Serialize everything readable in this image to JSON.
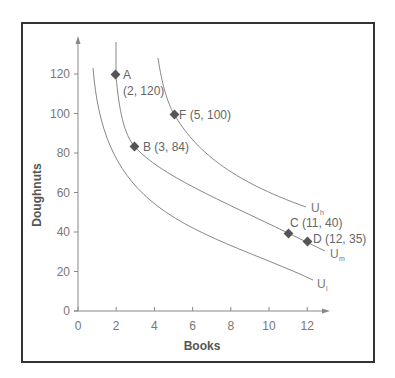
{
  "chart_data": {
    "type": "line",
    "title": "",
    "xlabel": "Books",
    "ylabel": "Doughnuts",
    "xlim": [
      0,
      13
    ],
    "ylim": [
      0,
      140
    ],
    "x_ticks": [
      "0",
      "2",
      "4",
      "6",
      "8",
      "10",
      "12"
    ],
    "y_ticks": [
      "0",
      "20",
      "40",
      "60",
      "80",
      "100",
      "120"
    ],
    "grid": false,
    "legend": "none (curves labeled inline)",
    "series": [
      {
        "name": "U_l",
        "label": "U",
        "subscript": "l",
        "description": "low indifference curve",
        "points": [
          [
            0.8,
            123
          ],
          [
            1.5,
            100
          ],
          [
            2.5,
            75
          ],
          [
            4,
            56
          ],
          [
            6,
            42
          ],
          [
            8,
            32
          ],
          [
            10,
            24
          ],
          [
            12,
            16
          ]
        ]
      },
      {
        "name": "U_m",
        "label": "U",
        "subscript": "m",
        "description": "middle indifference curve",
        "points": [
          [
            2,
            136
          ],
          [
            2,
            120
          ],
          [
            2.5,
            98
          ],
          [
            3,
            84
          ],
          [
            4,
            72
          ],
          [
            6,
            60
          ],
          [
            8,
            51
          ],
          [
            11,
            40
          ],
          [
            12,
            35
          ],
          [
            13,
            31
          ]
        ]
      },
      {
        "name": "U_h",
        "label": "U",
        "subscript": "h",
        "description": "high indifference curve",
        "points": [
          [
            4.2,
            128
          ],
          [
            5,
            100
          ],
          [
            6,
            85
          ],
          [
            8,
            68
          ],
          [
            10,
            59
          ],
          [
            12,
            53
          ]
        ]
      }
    ],
    "annotated_points": [
      {
        "id": "A",
        "x": 2,
        "y": 120,
        "label": "A",
        "coords": "(2, 120)",
        "curve": "U_m"
      },
      {
        "id": "B",
        "x": 3,
        "y": 84,
        "label": "B (3, 84)",
        "curve": "U_m"
      },
      {
        "id": "C",
        "x": 11,
        "y": 40,
        "label": "C (11, 40)",
        "curve": "U_m"
      },
      {
        "id": "D",
        "x": 12,
        "y": 35,
        "label": "D (12, 35)",
        "curve": "U_m"
      },
      {
        "id": "F",
        "x": 5,
        "y": 100,
        "label": "F (5, 100)",
        "curve": "U_h"
      }
    ]
  },
  "labels": {
    "x_axis_title": "Books",
    "y_axis_title": "Doughnuts",
    "point_A_name": "A",
    "point_A_coords": "(2, 120)",
    "point_B": "B (3, 84)",
    "point_C": "C (11, 40)",
    "point_D": "D (12, 35)",
    "point_F": "F (5, 100)",
    "curve_l_main": "U",
    "curve_l_sub": "l",
    "curve_m_main": "U",
    "curve_m_sub": "m",
    "curve_h_main": "U",
    "curve_h_sub": "h"
  }
}
